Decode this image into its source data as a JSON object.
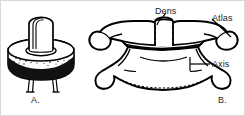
{
  "figure": {
    "title_alt": "Atlas and axis vertebrae illustration",
    "background_color": "#ffffff",
    "ink_color": "#000000",
    "panels": [
      {
        "id": "A",
        "caption": "A.",
        "description": "peg-in-ring model of dens within atlas ring"
      },
      {
        "id": "B",
        "caption": "B.",
        "description": "anterior view of articulated atlas and axis vertebrae"
      }
    ],
    "labels": [
      {
        "id": "dens",
        "text": "Dens",
        "leader": "curved-down-left"
      },
      {
        "id": "atlas",
        "text": "Atlas",
        "leader": "straight-down-left"
      },
      {
        "id": "axis",
        "text": "Axis",
        "leader": "straight-left-with-tick"
      }
    ]
  }
}
